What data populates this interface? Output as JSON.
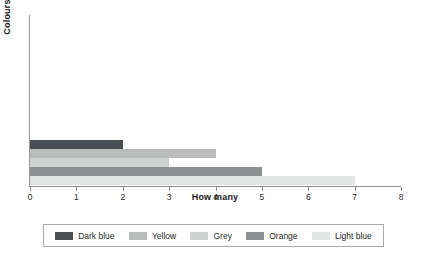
{
  "chart_data": {
    "type": "bar",
    "orientation": "horizontal",
    "title": "",
    "xlabel": "How many",
    "ylabel": "Colours",
    "xlim": [
      0,
      8
    ],
    "xticks": [
      0,
      1,
      2,
      3,
      4,
      5,
      6,
      7,
      8
    ],
    "xtick_labels": [
      "0",
      "1",
      "2",
      "3",
      "4",
      "5",
      "6",
      "7",
      "8"
    ],
    "grid": false,
    "legend_position": "bottom",
    "categories": [
      "Dark blue",
      "Yellow",
      "Grey",
      "Orange",
      "Light blue"
    ],
    "values": [
      2,
      4,
      3,
      5,
      7
    ],
    "series": [
      {
        "name": "Dark blue",
        "value": 2,
        "color": "#494f52"
      },
      {
        "name": "Yellow",
        "value": 4,
        "color": "#b9bcbb"
      },
      {
        "name": "Grey",
        "value": 3,
        "color": "#cfd1d0"
      },
      {
        "name": "Orange",
        "value": 5,
        "color": "#8b8f8f"
      },
      {
        "name": "Light blue",
        "value": 7,
        "color": "#e3e5e4"
      }
    ]
  },
  "legend": {
    "items": [
      {
        "label": "Dark blue",
        "color": "#494f52"
      },
      {
        "label": "Yellow",
        "color": "#b9bcbb"
      },
      {
        "label": "Grey",
        "color": "#cfd1d0"
      },
      {
        "label": "Orange",
        "color": "#8b8f8f"
      },
      {
        "label": "Light blue",
        "color": "#e3e5e4"
      }
    ]
  }
}
